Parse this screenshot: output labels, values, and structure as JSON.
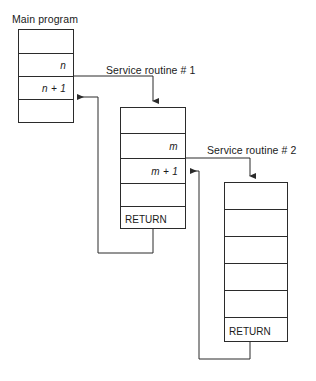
{
  "diagram": {
    "title_main": "Main program",
    "title_routine1": "Service routine # 1",
    "title_routine2": "Service routine # 2",
    "main_program": {
      "label": "Main program",
      "rows": [
        "",
        "n",
        "n + 1",
        ""
      ]
    },
    "service_routine_1": {
      "label": "Service routine # 1",
      "rows": [
        "",
        "m",
        "m + 1",
        "",
        "RETURN"
      ]
    },
    "service_routine_2": {
      "label": "Service routine # 2",
      "rows": [
        "",
        "",
        "",
        "",
        "",
        "RETURN"
      ]
    },
    "colors": {
      "line": "#2b2b2b",
      "text": "#1a1a1a",
      "background": "#ffffff"
    }
  }
}
